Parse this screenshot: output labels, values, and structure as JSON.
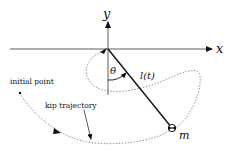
{
  "diagram": {
    "axes": {
      "x_label": "x",
      "y_label": "y"
    },
    "angle_label": "θ",
    "length_label": "l(t)",
    "mass_label": "m",
    "annotations": {
      "initial_point": "initial point",
      "kip_trajectory": "kip trajectory"
    },
    "colors": {
      "line": "#111111",
      "dashed": "#555555",
      "background": "#ffffff"
    }
  }
}
